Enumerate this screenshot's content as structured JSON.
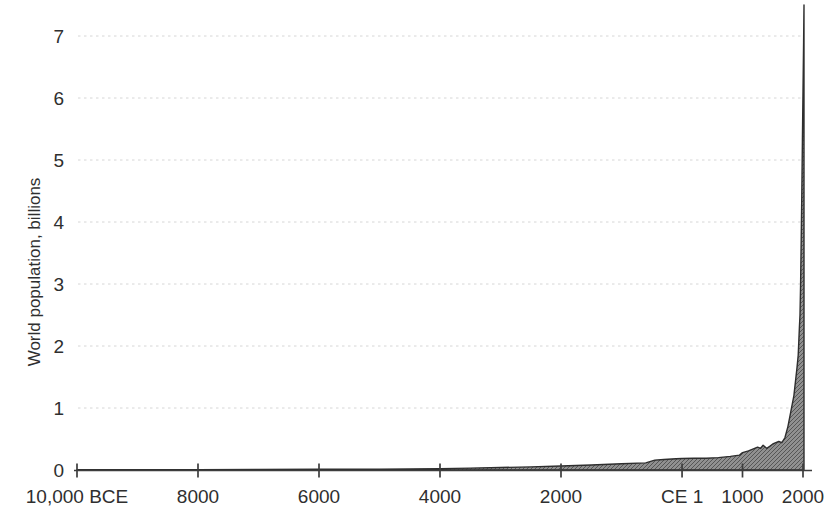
{
  "chart_data": {
    "type": "area",
    "title": "",
    "xlabel": "",
    "ylabel": "World population, billions",
    "x_ticks": [
      {
        "label": "10,000 BCE",
        "year": -10000
      },
      {
        "label": "8000",
        "year": -8000
      },
      {
        "label": "6000",
        "year": -6000
      },
      {
        "label": "4000",
        "year": -4000
      },
      {
        "label": "2000",
        "year": -2000
      },
      {
        "label": "CE 1",
        "year": 1
      },
      {
        "label": "1000",
        "year": 1000
      },
      {
        "label": "2000",
        "year": 2000
      }
    ],
    "y_ticks": [
      0,
      1,
      2,
      3,
      4,
      5,
      6,
      7
    ],
    "xlim": [
      -10000,
      2017
    ],
    "ylim": [
      0,
      7.6
    ],
    "grid": {
      "horizontal_dotted": true,
      "levels": [
        1,
        2,
        3,
        4,
        5,
        6,
        7
      ]
    },
    "legend": null,
    "series": [
      {
        "name": "World population (billions)",
        "points": [
          [
            -10000,
            0.004
          ],
          [
            -9000,
            0.005
          ],
          [
            -8000,
            0.006
          ],
          [
            -7000,
            0.008
          ],
          [
            -6000,
            0.011
          ],
          [
            -5000,
            0.015
          ],
          [
            -4500,
            0.018
          ],
          [
            -4000,
            0.022
          ],
          [
            -3500,
            0.03
          ],
          [
            -3000,
            0.04
          ],
          [
            -2500,
            0.05
          ],
          [
            -2000,
            0.065
          ],
          [
            -1500,
            0.08
          ],
          [
            -1000,
            0.1
          ],
          [
            -600,
            0.115
          ],
          [
            -450,
            0.16
          ],
          [
            -300,
            0.17
          ],
          [
            -100,
            0.18
          ],
          [
            1,
            0.185
          ],
          [
            200,
            0.19
          ],
          [
            400,
            0.19
          ],
          [
            600,
            0.2
          ],
          [
            800,
            0.22
          ],
          [
            950,
            0.24
          ],
          [
            1000,
            0.28
          ],
          [
            1100,
            0.31
          ],
          [
            1200,
            0.35
          ],
          [
            1250,
            0.37
          ],
          [
            1300,
            0.35
          ],
          [
            1340,
            0.4
          ],
          [
            1400,
            0.35
          ],
          [
            1450,
            0.38
          ],
          [
            1500,
            0.42
          ],
          [
            1550,
            0.44
          ],
          [
            1600,
            0.46
          ],
          [
            1650,
            0.44
          ],
          [
            1700,
            0.52
          ],
          [
            1750,
            0.7
          ],
          [
            1800,
            0.95
          ],
          [
            1850,
            1.2
          ],
          [
            1900,
            1.65
          ],
          [
            1920,
            1.85
          ],
          [
            1940,
            2.3
          ],
          [
            1950,
            2.5
          ],
          [
            1960,
            3.0
          ],
          [
            1970,
            3.7
          ],
          [
            1980,
            4.45
          ],
          [
            1990,
            5.3
          ],
          [
            2000,
            6.1
          ],
          [
            2010,
            6.9
          ],
          [
            2017,
            7.5
          ]
        ]
      }
    ]
  },
  "style": {
    "background": "#ffffff",
    "text_color": "#2f2f2f",
    "axis_color": "#3d3d3d",
    "grid_color": "#d6d6d6",
    "area_fill": "#909090",
    "area_hatch": "#565656",
    "area_outline": "#2e2e2e"
  }
}
